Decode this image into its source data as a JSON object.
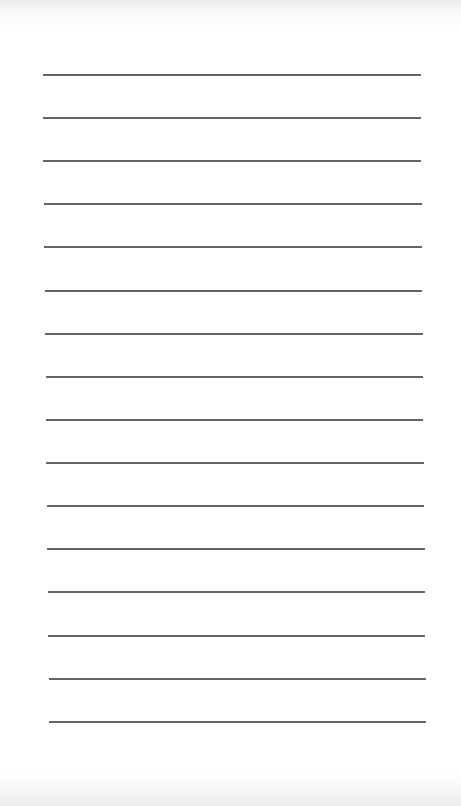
{
  "document": {
    "type": "lined-paper",
    "background_color": "#ffffff",
    "rule_color": "#4a4a4a",
    "rule_count": 16,
    "rules": [
      {
        "y": 74,
        "x1": 43,
        "x2": 421
      },
      {
        "y": 117,
        "x1": 43,
        "x2": 421
      },
      {
        "y": 160,
        "x1": 43,
        "x2": 421
      },
      {
        "y": 203,
        "x1": 44,
        "x2": 422
      },
      {
        "y": 246,
        "x1": 44,
        "x2": 422
      },
      {
        "y": 290,
        "x1": 45,
        "x2": 422
      },
      {
        "y": 333,
        "x1": 45,
        "x2": 423
      },
      {
        "y": 376,
        "x1": 46,
        "x2": 423
      },
      {
        "y": 419,
        "x1": 46,
        "x2": 423
      },
      {
        "y": 462,
        "x1": 46,
        "x2": 424
      },
      {
        "y": 505,
        "x1": 47,
        "x2": 424
      },
      {
        "y": 548,
        "x1": 47,
        "x2": 425
      },
      {
        "y": 591,
        "x1": 48,
        "x2": 425
      },
      {
        "y": 635,
        "x1": 48,
        "x2": 425
      },
      {
        "y": 678,
        "x1": 49,
        "x2": 426
      },
      {
        "y": 721,
        "x1": 49,
        "x2": 426
      }
    ]
  }
}
